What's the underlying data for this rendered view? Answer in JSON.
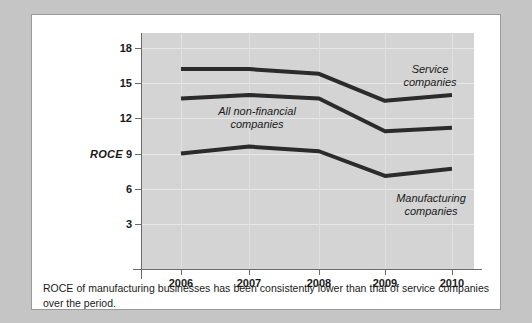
{
  "chart_data": {
    "type": "line",
    "title": "",
    "xlabel": "",
    "ylabel": "ROCE",
    "categories": [
      "2006",
      "2007",
      "2008",
      "2009",
      "2010"
    ],
    "ylim": [
      0,
      18
    ],
    "yticks": [
      3,
      6,
      9,
      12,
      15,
      18
    ],
    "grid": true,
    "legend_position": "inline-annotations",
    "series": [
      {
        "name": "Service companies",
        "values": [
          16.2,
          16.2,
          15.8,
          13.5,
          14.0
        ],
        "color": "#2b2b2b"
      },
      {
        "name": "All non-financial companies",
        "values": [
          13.7,
          14.0,
          13.7,
          10.9,
          11.2
        ],
        "color": "#2b2b2b"
      },
      {
        "name": "Manufacturing companies",
        "values": [
          9.0,
          9.6,
          9.2,
          7.1,
          7.7
        ],
        "color": "#2b2b2b"
      }
    ],
    "annotations": [
      {
        "text": "Service companies",
        "line1": "Service",
        "line2": "companies"
      },
      {
        "text": "All non-financial companies",
        "line1": "All non-financial",
        "line2": "companies"
      },
      {
        "text": "Manufacturing companies",
        "line1": "Manufacturing",
        "line2": "companies"
      }
    ]
  },
  "axis": {
    "y_title": "ROCE",
    "y_ticks": [
      "18",
      "15",
      "12",
      "9",
      "6",
      "3"
    ],
    "x_ticks": [
      "2006",
      "2007",
      "2008",
      "2009",
      "2010"
    ]
  },
  "annotations": {
    "service_line1": "Service",
    "service_line2": "companies",
    "allnonfin_line1": "All non-financial",
    "allnonfin_line2": "companies",
    "manufacturing_line1": "Manufacturing",
    "manufacturing_line2": "companies"
  },
  "caption": {
    "text": "ROCE of manufacturing businesses has been consistently lower than that of service companies over the period."
  },
  "colors": {
    "panel_background": "#d4d4d4",
    "card_background": "#ffffff",
    "page_background": "#c5c5c5",
    "line": "#2b2b2b",
    "axis": "#6b6b6b",
    "gridline": "#e8e8e8"
  }
}
